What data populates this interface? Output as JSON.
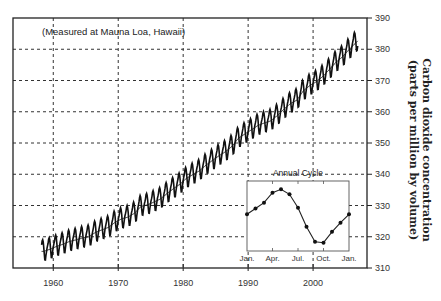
{
  "chart_data": [
    {
      "type": "line",
      "title": "",
      "annotation": "(Measured at Mauna Loa, Hawaii)",
      "xlabel": "",
      "ylabel_lines": [
        "Carbon dioxide concentration",
        "(parts per million by volume)"
      ],
      "y_axis_side": "right",
      "xlim": [
        1953.8,
        2008.3
      ],
      "ylim": [
        310,
        390
      ],
      "x_ticks": [
        1960,
        1970,
        1980,
        1990,
        2000
      ],
      "x_tick_labels": [
        "1960",
        "1970",
        "1980",
        "1990",
        "2000"
      ],
      "y_ticks": [
        310,
        320,
        330,
        340,
        350,
        360,
        370,
        380,
        390
      ],
      "y_tick_labels": [
        "310",
        "320",
        "330",
        "340",
        "350",
        "360",
        "370",
        "380",
        "390"
      ],
      "grid": true,
      "series": [
        {
          "name": "Annual mean CO2 (ppm)",
          "x": [
            1958,
            1959,
            1960,
            1961,
            1962,
            1963,
            1964,
            1965,
            1966,
            1967,
            1968,
            1969,
            1970,
            1971,
            1972,
            1973,
            1974,
            1975,
            1976,
            1977,
            1978,
            1979,
            1980,
            1981,
            1982,
            1983,
            1984,
            1985,
            1986,
            1987,
            1988,
            1989,
            1990,
            1991,
            1992,
            1993,
            1994,
            1995,
            1996,
            1997,
            1998,
            1999,
            2000,
            2001,
            2002,
            2003,
            2004,
            2005,
            2006
          ],
          "values": [
            315.3,
            316.0,
            316.9,
            317.6,
            318.5,
            319.0,
            319.6,
            320.0,
            321.4,
            322.2,
            323.0,
            324.6,
            325.7,
            326.3,
            327.5,
            329.7,
            330.2,
            331.1,
            332.1,
            333.8,
            335.4,
            336.8,
            338.7,
            339.9,
            341.1,
            342.9,
            344.4,
            345.9,
            347.2,
            348.9,
            351.5,
            352.9,
            354.2,
            355.6,
            356.4,
            357.1,
            358.8,
            360.8,
            362.6,
            363.7,
            366.7,
            368.4,
            369.6,
            371.3,
            373.5,
            375.8,
            377.5,
            379.8,
            381.9
          ]
        }
      ],
      "seasonal_amplitude_ppm": 6.5
    },
    {
      "type": "line",
      "title": "Annual Cycle",
      "categories": [
        "Jan.",
        "Feb.",
        "Mar.",
        "Apr.",
        "May",
        "Jun.",
        "Jul.",
        "Aug.",
        "Sep.",
        "Oct.",
        "Nov.",
        "Dec.",
        "Jan."
      ],
      "x_tick_labels": [
        "Jan.",
        "Apr.",
        "Jul.",
        "Oct.",
        "Jan."
      ],
      "x_tick_indices": [
        0,
        3,
        6,
        9,
        12
      ],
      "values": [
        0.6,
        1.3,
        2.0,
        3.2,
        3.6,
        3.0,
        1.4,
        -0.9,
        -2.7,
        -2.8,
        -1.5,
        -0.4,
        0.6
      ],
      "ylim": [
        -3.8,
        4.6
      ],
      "markers": true,
      "position": "bottom-right"
    }
  ]
}
